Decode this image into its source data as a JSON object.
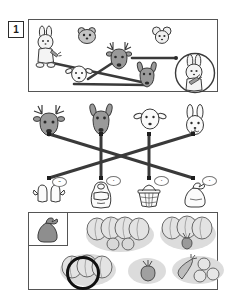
{
  "worksheet": {
    "exercise_number": "1",
    "title_present": false
  },
  "panels": {
    "top": {
      "name": "animals-and-food-panel",
      "figures": [
        {
          "id": "rabbit-standing-with-carrot",
          "label": "rabbit",
          "x": 33,
          "y": 26,
          "w": 26,
          "h": 40,
          "tone": "light"
        },
        {
          "id": "hamster-head",
          "label": "hamster",
          "x": 76,
          "y": 26,
          "w": 20,
          "h": 17,
          "tone": "mid"
        },
        {
          "id": "mouse-head",
          "label": "mouse",
          "x": 152,
          "y": 26,
          "w": 18,
          "h": 17,
          "tone": "light"
        },
        {
          "id": "deer-head",
          "label": "deer",
          "x": 106,
          "y": 43,
          "w": 28,
          "h": 28,
          "tone": "dark"
        },
        {
          "id": "sheep-head",
          "label": "sheep",
          "x": 68,
          "y": 64,
          "w": 22,
          "h": 17,
          "tone": "light"
        },
        {
          "id": "donkey-head",
          "label": "donkey",
          "x": 138,
          "y": 64,
          "w": 20,
          "h": 22,
          "tone": "dark"
        },
        {
          "id": "rabbit-in-circle-with-carrot",
          "label": "rabbit-circled",
          "x": 174,
          "y": 52,
          "w": 40,
          "h": 40,
          "tone": "light"
        }
      ],
      "connections": [
        {
          "from": "rabbit-standing-with-carrot",
          "to": "donkey-head"
        },
        {
          "from": "sheep-head",
          "to": "deer-head"
        },
        {
          "from": "deer-head",
          "to": "rabbit-in-circle-with-carrot"
        },
        {
          "from": "sheep-head",
          "to": "donkey-head"
        }
      ]
    },
    "middle": {
      "name": "match-animals-to-items-panel",
      "animals": [
        {
          "id": "deer-head",
          "label": "deer",
          "x": 32,
          "y": 104,
          "tone": "dark"
        },
        {
          "id": "donkey-head",
          "label": "donkey",
          "x": 88,
          "y": 104,
          "tone": "dark"
        },
        {
          "id": "sheep-head",
          "label": "sheep",
          "x": 136,
          "y": 105,
          "tone": "light"
        },
        {
          "id": "188",
          "label": "rabbit",
          "x": 184,
          "y": 104,
          "tone": "light"
        }
      ],
      "items": [
        {
          "id": "mittens",
          "label": "mittens",
          "x": 32,
          "y": 182,
          "badge": "••"
        },
        {
          "id": "backpack",
          "label": "backpack",
          "x": 88,
          "y": 181,
          "badge": "•"
        },
        {
          "id": "basket",
          "label": "basket",
          "x": 136,
          "y": 181,
          "badge": "•"
        },
        {
          "id": "sack",
          "label": "sack",
          "x": 184,
          "y": 181,
          "badge": "•"
        }
      ],
      "connections": [
        {
          "from": "deer-head",
          "to": "sack",
          "type": "diagonal"
        },
        {
          "from": "rabbit-head",
          "to": "mittens",
          "type": "diagonal"
        },
        {
          "from": "donkey-head",
          "to": "backpack",
          "type": "vertical"
        },
        {
          "from": "sheep-head",
          "to": "basket",
          "type": "vertical"
        }
      ]
    },
    "bottom": {
      "name": "vegetable-groups-panel",
      "reference_item": {
        "id": "sack",
        "label": "sack",
        "x": 34,
        "y": 216
      },
      "groups": [
        {
          "id": "group-cabbages-and-turnips",
          "label": "4 cabbages + 2 turnips",
          "x": 86,
          "y": 216,
          "w": 68,
          "h": 36,
          "selected": false
        },
        {
          "id": "group-cabbages-and-beet",
          "label": "3 cabbages + beet",
          "x": 160,
          "y": 216,
          "w": 56,
          "h": 34,
          "selected": false
        },
        {
          "id": "group-cabbages-circled",
          "label": "3 cabbages",
          "x": 60,
          "y": 252,
          "w": 56,
          "h": 34,
          "selected": true
        },
        {
          "id": "group-single-beet",
          "label": "1 beet",
          "x": 128,
          "y": 256,
          "w": 38,
          "h": 28,
          "selected": false
        },
        {
          "id": "group-carrot-and-turnips",
          "label": "carrot + 3 turnips",
          "x": 172,
          "y": 254,
          "w": 52,
          "h": 30,
          "selected": false
        }
      ],
      "selection_marker": {
        "shape": "circle",
        "x": 66,
        "y": 256,
        "size": 28,
        "color": "#111111"
      }
    }
  },
  "colors": {
    "ink": "#2b2b2b",
    "panel_border": "#555555",
    "line": "#3a3a3a",
    "fill_light": "#f0f0f0",
    "fill_mid": "#bfbfbf",
    "fill_dark": "#8c8c8c",
    "blob": "#dcdcdc",
    "selection": "#111111",
    "paper": "#ffffff"
  }
}
